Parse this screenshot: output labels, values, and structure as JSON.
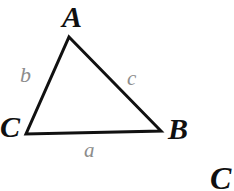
{
  "figure": {
    "kind": "geometry-diagram",
    "shape": "triangle",
    "background_color": "#ffffff",
    "stroke_color": "#111111",
    "stroke_width": 3,
    "vertex_label_color": "#101010",
    "side_label_color": "#8c8c8c",
    "width": 234,
    "height": 191
  },
  "vertices": [
    {
      "id": "A",
      "label": "A",
      "x": 69,
      "y": 37
    },
    {
      "id": "B",
      "label": "B",
      "x": 161,
      "y": 131
    },
    {
      "id": "C",
      "label": "C",
      "x": 26,
      "y": 134
    }
  ],
  "sides": [
    {
      "id": "a",
      "label": "a",
      "between": "C-B"
    },
    {
      "id": "b",
      "label": "b",
      "between": "C-A"
    },
    {
      "id": "c",
      "label": "c",
      "between": "A-B"
    }
  ],
  "labels": {
    "vertex_a": "A",
    "vertex_b": "B",
    "vertex_c": "C",
    "side_a": "a",
    "side_b": "b",
    "side_c": "c",
    "stray_partial": "C"
  }
}
